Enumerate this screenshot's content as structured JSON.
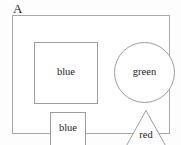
{
  "diagram": {
    "panel_label": "A",
    "background_color": "#fdfdfd",
    "frame_color": "#a9a9a9",
    "shape_outline_color": "#9d9d9d",
    "shape_fill_color": "#ffffff",
    "text_color": "#1c1c1c",
    "shapes": [
      {
        "id": "square-large",
        "kind": "square",
        "label": "blue",
        "x": 21,
        "y": 26,
        "width": 64,
        "height": 62
      },
      {
        "id": "circle-green",
        "kind": "circle",
        "label": "green",
        "x": 101,
        "y": 26,
        "width": 61,
        "height": 61
      },
      {
        "id": "square-small",
        "kind": "square",
        "label": "blue",
        "x": 37,
        "y": 96,
        "width": 36,
        "height": 34
      },
      {
        "id": "triangle-red",
        "kind": "triangle",
        "label": "red",
        "x": 112,
        "y": 93,
        "width": 42,
        "height": 39
      }
    ]
  }
}
